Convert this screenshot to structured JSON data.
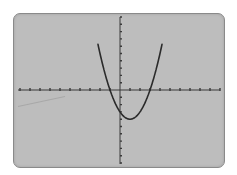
{
  "device": "graphing-calculator-screen",
  "colors": {
    "screen_bg": "#bdbdbd",
    "curve": "#2b2b2b",
    "axes": "#3a3a3a"
  },
  "chart_data": {
    "type": "line",
    "title": "",
    "xlabel": "",
    "ylabel": "",
    "function": "y = x^2 - 2x - 3",
    "window": {
      "xmin": -10,
      "xmax": 10,
      "xscl": 1,
      "ymin": -10,
      "ymax": 10,
      "yscl": 1
    },
    "xlim": [
      -10,
      10
    ],
    "ylim": [
      -10,
      10
    ],
    "grid": false,
    "legend": null,
    "tick_labels": false,
    "key_points": {
      "vertex": [
        1,
        -4
      ],
      "x_intercepts": [
        -1,
        3
      ],
      "y_intercept": [
        0,
        -3
      ]
    },
    "series": [
      {
        "name": "parabola",
        "x": [
          -1.8,
          -1.5,
          -1,
          -0.5,
          0,
          0.5,
          1,
          1.5,
          2,
          2.5,
          3,
          3.5,
          3.8
        ],
        "y": [
          3.84,
          2.25,
          0,
          -1.75,
          -3,
          -3.75,
          -4,
          -3.75,
          -3,
          -1.75,
          0,
          2.25,
          3.84
        ]
      }
    ]
  }
}
